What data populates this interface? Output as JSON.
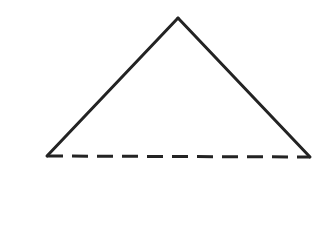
{
  "canvas": {
    "width": 323,
    "height": 249,
    "background_color": "#ffffff"
  },
  "label": {
    "text": "2.",
    "color": "#2a2a2a",
    "x": 4,
    "y": 10,
    "font_size": 21
  },
  "figure": {
    "name": "triangle",
    "stroke_color": "#232323",
    "stroke_width": 3,
    "fill": "none",
    "vertices": {
      "apex": {
        "x": 178,
        "y": 18
      },
      "bottom_left": {
        "x": 47,
        "y": 156
      },
      "bottom_right": {
        "x": 310,
        "y": 157
      }
    },
    "sides": [
      {
        "name": "left-side",
        "style": "solid",
        "from": {
          "x": 47,
          "y": 156
        },
        "to": {
          "x": 178,
          "y": 18
        }
      },
      {
        "name": "right-side",
        "style": "solid",
        "from": {
          "x": 178,
          "y": 18
        },
        "to": {
          "x": 310,
          "y": 157
        }
      },
      {
        "name": "base",
        "style": "dashed",
        "dash_length": 16,
        "gap_length": 9,
        "from": {
          "x": 47,
          "y": 156
        },
        "to": {
          "x": 310,
          "y": 157
        }
      }
    ]
  }
}
